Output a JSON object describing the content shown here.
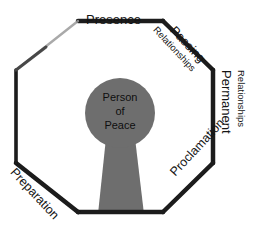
{
  "diagram": {
    "shape": "octagon",
    "colors": {
      "outline": "#1a1a1a",
      "keyhole_fill": "#6e6e6e",
      "background": "#ffffff",
      "text": "#141414"
    },
    "center": {
      "name": "keyhole-person-of-peace",
      "line1": "Person",
      "line2": "of",
      "line3": "Peace"
    },
    "edges": [
      {
        "id": "presence",
        "position": "top",
        "label": "Presence",
        "sublabel": "",
        "rotation_deg": 0
      },
      {
        "id": "passing-relationships",
        "position": "top-right",
        "label": "Passing",
        "sublabel": "Relationships",
        "rotation_deg": 47
      },
      {
        "id": "permanent-relationships",
        "position": "right",
        "label": "Permanent",
        "sublabel": "Relationships",
        "rotation_deg": 90
      },
      {
        "id": "proclamation",
        "position": "bottom-right",
        "label": "Proclamation",
        "sublabel": "",
        "rotation_deg": -47
      },
      {
        "id": "preparation",
        "position": "bottom-left",
        "label": "Preparation",
        "sublabel": "",
        "rotation_deg": 47
      }
    ]
  }
}
